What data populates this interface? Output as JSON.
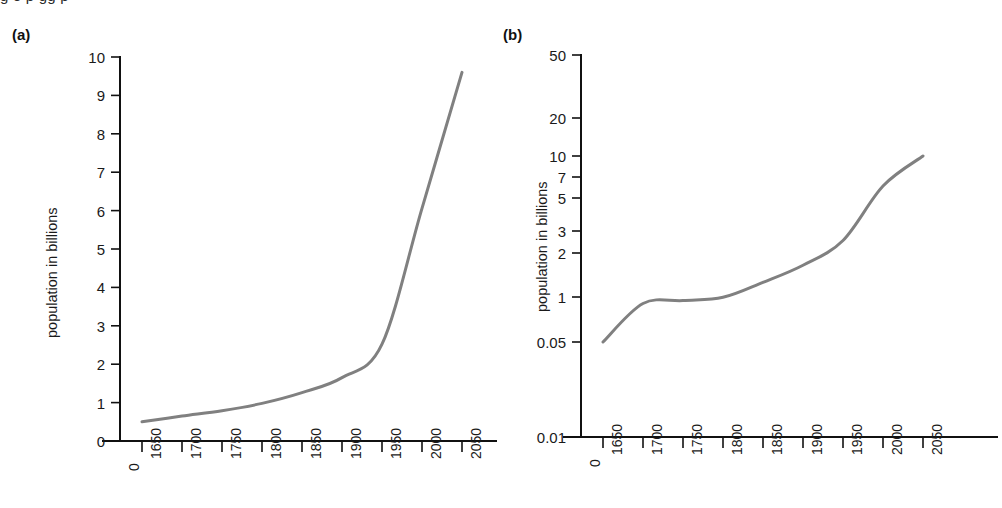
{
  "figure": {
    "caption_fragment": "g  o  p  gg p",
    "panel_a_label": "(a)",
    "panel_b_label": "(b)",
    "curve_color": "#808080",
    "axis_color": "#111111"
  },
  "chart_data": [
    {
      "type": "line",
      "panel": "(a)",
      "title": "",
      "xlabel": "",
      "ylabel": "population in billions",
      "yscale": "linear",
      "ylim": [
        0,
        10
      ],
      "ytick_labels": [
        "0",
        "1",
        "2",
        "3",
        "4",
        "5",
        "6",
        "7",
        "8",
        "9",
        "10"
      ],
      "ytick_values": [
        0,
        1,
        2,
        3,
        4,
        5,
        6,
        7,
        8,
        9,
        10
      ],
      "xtick_labels": [
        "0",
        "1650",
        "1700",
        "1750",
        "1800",
        "1850",
        "1900",
        "1950",
        "2000",
        "2050"
      ],
      "x": [
        1650,
        1700,
        1750,
        1800,
        1850,
        1900,
        1950,
        2000,
        2050
      ],
      "values": [
        0.5,
        0.65,
        0.79,
        0.98,
        1.26,
        1.65,
        2.52,
        6.06,
        9.6
      ],
      "grid": false,
      "legend": "none"
    },
    {
      "type": "line",
      "panel": "(b)",
      "title": "",
      "xlabel": "",
      "ylabel": "population in billions",
      "yscale": "log",
      "ylim": [
        0.01,
        50
      ],
      "ytick_labels": [
        "0.01",
        "0.05",
        "1",
        "2",
        "3",
        "5",
        "7",
        "10",
        "20",
        "50"
      ],
      "ytick_values": [
        0.01,
        0.05,
        1,
        2,
        3,
        5,
        7,
        10,
        20,
        50
      ],
      "xtick_labels": [
        "0",
        "1650",
        "1700",
        "1750",
        "1800",
        "1850",
        "1900",
        "1950",
        "2000",
        "2050"
      ],
      "x": [
        1650,
        1700,
        1750,
        1800,
        1850,
        1900,
        1950,
        2000,
        2050
      ],
      "values": [
        0.05,
        0.65,
        0.79,
        0.98,
        1.26,
        1.65,
        2.52,
        6.06,
        10.0
      ],
      "grid": false,
      "legend": "none"
    }
  ]
}
